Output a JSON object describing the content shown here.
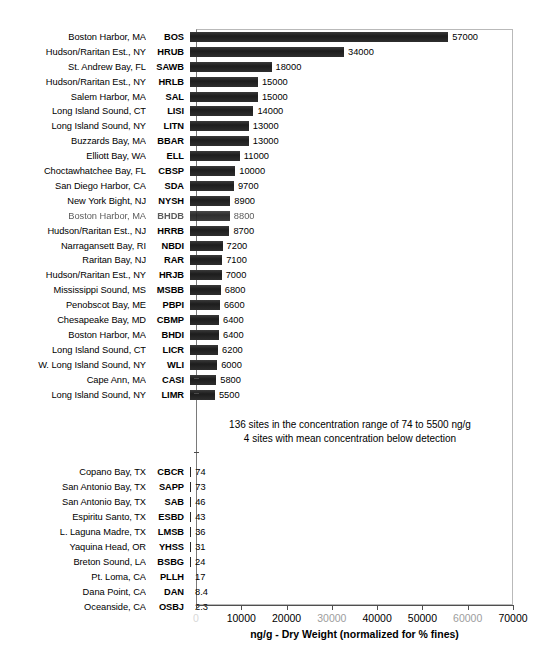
{
  "chart_data": {
    "type": "bar",
    "orientation": "horizontal",
    "title": "",
    "xlabel": "ng/g - Dry Weight (normalized for % fines)",
    "ylabel": "",
    "xlim": [
      0,
      70000
    ],
    "xticks": [
      0,
      10000,
      20000,
      30000,
      40000,
      50000,
      60000,
      70000
    ],
    "xticklabels": [
      "0",
      "10000",
      "20000",
      "30000",
      "40000",
      "50000",
      "60000",
      "70000"
    ],
    "grid": false,
    "legend": null,
    "bar_color": "#272727",
    "categories": [
      "BOS",
      "HRUB",
      "SAWB",
      "HRLB",
      "SAL",
      "LISI",
      "LITN",
      "BBAR",
      "ELL",
      "CBSP",
      "SDA",
      "NYSH",
      "BHDB",
      "HRRB",
      "NBDI",
      "RAR",
      "HRJB",
      "MSBB",
      "PBPI",
      "CBMP",
      "BHDI",
      "LICR",
      "WLI",
      "CASI",
      "LIMR",
      "CBCR",
      "SAPP",
      "SAB",
      "ESBD",
      "LMSB",
      "YHSS",
      "BSBG",
      "PLLH",
      "DAN",
      "OSBJ"
    ],
    "values": [
      57000,
      34000,
      18000,
      15000,
      15000,
      14000,
      13000,
      13000,
      11000,
      10000,
      9700,
      8900,
      8800,
      8700,
      7200,
      7100,
      7000,
      6800,
      6600,
      6400,
      6400,
      6200,
      6000,
      5800,
      5500,
      74,
      73,
      46,
      43,
      36,
      31,
      24,
      17,
      8.4,
      2.3
    ],
    "site_names": [
      "Boston Harbor, MA",
      "Hudson/Raritan Est., NY",
      "St. Andrew Bay, FL",
      "Hudson/Raritan Est., NY",
      "Salem Harbor, MA",
      "Long Island Sound, CT",
      "Long Island Sound, NY",
      "Buzzards Bay, MA",
      "Elliott Bay, WA",
      "Choctawhatchee Bay, FL",
      "San Diego Harbor, CA",
      "New York Bight, NJ",
      "Boston Harbor, MA",
      "Hudson/Raritan Est., NJ",
      "Narragansett Bay, RI",
      "Raritan Bay, NJ",
      "Hudson/Raritan Est., NY",
      "Mississippi Sound, MS",
      "Penobscot Bay, ME",
      "Chesapeake Bay, MD",
      "Boston Harbor, MA",
      "Long Island Sound, CT",
      "W. Long Island Sound, NY",
      "Cape Ann, MA",
      "Long Island Sound, NY",
      "Copano Bay, TX",
      "San Antonio Bay, TX",
      "San Antonio Bay, TX",
      "Espiritu Santo, TX",
      "L. Laguna Madre, TX",
      "Yaquina Head, OR",
      "Breton Sound, LA",
      "Pt. Loma, CA",
      "Dana Point, CA",
      "Oceanside, CA"
    ],
    "annotations": [
      "136 sites in the concentration range of 74 to 5500 ng/g",
      "4 sites with mean concentration below detection"
    ]
  },
  "rows_top": [
    {
      "site": "Boston Harbor, MA",
      "code": "BOS",
      "value": 57000,
      "label": "57000",
      "faded": false
    },
    {
      "site": "Hudson/Raritan Est., NY",
      "code": "HRUB",
      "value": 34000,
      "label": "34000",
      "faded": false
    },
    {
      "site": "St. Andrew Bay, FL",
      "code": "SAWB",
      "value": 18000,
      "label": "18000",
      "faded": false
    },
    {
      "site": "Hudson/Raritan Est., NY",
      "code": "HRLB",
      "value": 15000,
      "label": "15000",
      "faded": false
    },
    {
      "site": "Salem Harbor, MA",
      "code": "SAL",
      "value": 15000,
      "label": "15000",
      "faded": false
    },
    {
      "site": "Long Island Sound, CT",
      "code": "LISI",
      "value": 14000,
      "label": "14000",
      "faded": false
    },
    {
      "site": "Long Island Sound, NY",
      "code": "LITN",
      "value": 13000,
      "label": "13000",
      "faded": false
    },
    {
      "site": "Buzzards Bay, MA",
      "code": "BBAR",
      "value": 13000,
      "label": "13000",
      "faded": false
    },
    {
      "site": "Elliott Bay, WA",
      "code": "ELL",
      "value": 11000,
      "label": "11000",
      "faded": false
    },
    {
      "site": "Choctawhatchee Bay, FL",
      "code": "CBSP",
      "value": 10000,
      "label": "10000",
      "faded": false
    },
    {
      "site": "San Diego Harbor, CA",
      "code": "SDA",
      "value": 9700,
      "label": "9700",
      "faded": false
    },
    {
      "site": "New York Bight, NJ",
      "code": "NYSH",
      "value": 8900,
      "label": "8900",
      "faded": false
    },
    {
      "site": "Boston Harbor, MA",
      "code": "BHDB",
      "value": 8800,
      "label": "8800",
      "faded": true
    },
    {
      "site": "Hudson/Raritan Est., NJ",
      "code": "HRRB",
      "value": 8700,
      "label": "8700",
      "faded": false
    },
    {
      "site": "Narragansett Bay, RI",
      "code": "NBDI",
      "value": 7200,
      "label": "7200",
      "faded": false
    },
    {
      "site": "Raritan Bay, NJ",
      "code": "RAR",
      "value": 7100,
      "label": "7100",
      "faded": false
    },
    {
      "site": "Hudson/Raritan Est., NY",
      "code": "HRJB",
      "value": 7000,
      "label": "7000",
      "faded": false
    },
    {
      "site": "Mississippi Sound, MS",
      "code": "MSBB",
      "value": 6800,
      "label": "6800",
      "faded": false
    },
    {
      "site": "Penobscot Bay, ME",
      "code": "PBPI",
      "value": 6600,
      "label": "6600",
      "faded": false
    },
    {
      "site": "Chesapeake Bay, MD",
      "code": "CBMP",
      "value": 6400,
      "label": "6400",
      "faded": false
    },
    {
      "site": "Boston Harbor, MA",
      "code": "BHDI",
      "value": 6400,
      "label": "6400",
      "faded": false
    },
    {
      "site": "Long Island Sound, CT",
      "code": "LICR",
      "value": 6200,
      "label": "6200",
      "faded": false
    },
    {
      "site": "W. Long Island Sound, NY",
      "code": "WLI",
      "value": 6000,
      "label": "6000",
      "faded": false
    },
    {
      "site": "Cape Ann, MA",
      "code": "CASI",
      "value": 5800,
      "label": "5800",
      "faded": false
    },
    {
      "site": "Long Island Sound, NY",
      "code": "LIMR",
      "value": 5500,
      "label": "5500",
      "faded": false
    }
  ],
  "rows_bottom": [
    {
      "site": "Copano Bay, TX",
      "code": "CBCR",
      "value": 74,
      "label": "74"
    },
    {
      "site": "San Antonio Bay, TX",
      "code": "SAPP",
      "value": 73,
      "label": "73"
    },
    {
      "site": "San Antonio Bay, TX",
      "code": "SAB",
      "value": 46,
      "label": "46"
    },
    {
      "site": "Espiritu Santo, TX",
      "code": "ESBD",
      "value": 43,
      "label": "43"
    },
    {
      "site": "L. Laguna Madre, TX",
      "code": "LMSB",
      "value": 36,
      "label": "36"
    },
    {
      "site": "Yaquina Head, OR",
      "code": "YHSS",
      "value": 31,
      "label": "31"
    },
    {
      "site": "Breton Sound, LA",
      "code": "BSBG",
      "value": 24,
      "label": "24"
    },
    {
      "site": "Pt. Loma, CA",
      "code": "PLLH",
      "value": 17,
      "label": "17"
    },
    {
      "site": "Dana Point, CA",
      "code": "DAN",
      "value": 8.4,
      "label": "8.4"
    },
    {
      "site": "Oceanside, CA",
      "code": "OSBJ",
      "value": 2.3,
      "label": "2.3"
    }
  ],
  "annotation": {
    "line1": "136 sites in the concentration range of 74 to 5500 ng/g",
    "line2": "4 sites with mean concentration below detection"
  },
  "axis": {
    "title": "ng/g - Dry Weight (normalized for % fines)",
    "ticks": [
      "0",
      "10000",
      "20000",
      "30000",
      "40000",
      "50000",
      "60000",
      "70000"
    ],
    "max": 70000
  },
  "caption": {
    "text": ""
  }
}
